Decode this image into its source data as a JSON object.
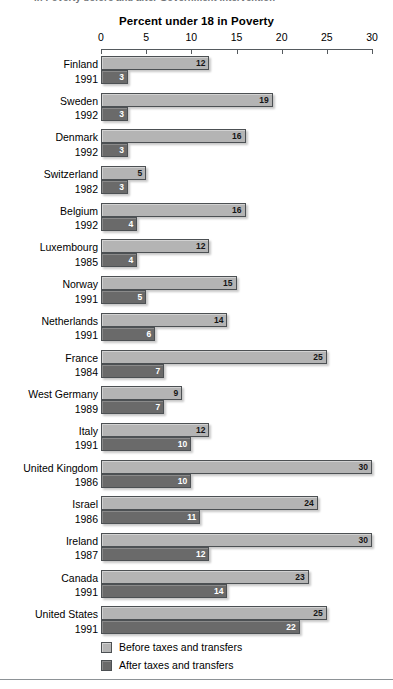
{
  "title_clipped": "in Poverty before and after Government Intervention",
  "axis_title": "Percent under 18 in Poverty",
  "legend": {
    "items": [
      {
        "label": "Before taxes and transfers",
        "color": "#b4b4b4",
        "swatch": "before"
      },
      {
        "label": "After taxes and transfers",
        "color": "#6a6a6a",
        "swatch": "after"
      }
    ]
  },
  "chart_data": {
    "type": "bar",
    "orientation": "horizontal",
    "title": "Percent under 18 in Poverty",
    "xlabel": "Percent under 18 in Poverty",
    "ylabel": "",
    "xlim": [
      0,
      30
    ],
    "xticks": [
      0,
      5,
      10,
      15,
      20,
      25,
      30
    ],
    "grid": false,
    "legend_position": "bottom-left",
    "categories": [
      "Finland 1991",
      "Sweden 1992",
      "Denmark 1992",
      "Switzerland 1982",
      "Belgium 1992",
      "Luxembourg 1985",
      "Norway 1991",
      "Netherlands 1991",
      "France 1984",
      "West Germany 1989",
      "Italy 1991",
      "United Kingdom 1986",
      "Israel 1986",
      "Ireland 1987",
      "Canada 1991",
      "United States 1991"
    ],
    "series": [
      {
        "name": "Before taxes and transfers",
        "color": "#b4b4b4",
        "values": [
          12,
          19,
          16,
          5,
          16,
          12,
          15,
          14,
          25,
          9,
          12,
          30,
          24,
          30,
          23,
          25
        ]
      },
      {
        "name": "After taxes and transfers",
        "color": "#6a6a6a",
        "values": [
          3,
          3,
          3,
          3,
          4,
          4,
          5,
          6,
          7,
          7,
          10,
          10,
          11,
          12,
          14,
          22
        ]
      }
    ]
  },
  "rows": [
    {
      "country": "Finland",
      "year": "1991",
      "before": 12,
      "after": 3
    },
    {
      "country": "Sweden",
      "year": "1992",
      "before": 19,
      "after": 3
    },
    {
      "country": "Denmark",
      "year": "1992",
      "before": 16,
      "after": 3
    },
    {
      "country": "Switzerland",
      "year": "1982",
      "before": 5,
      "after": 3
    },
    {
      "country": "Belgium",
      "year": "1992",
      "before": 16,
      "after": 4
    },
    {
      "country": "Luxembourg",
      "year": "1985",
      "before": 12,
      "after": 4
    },
    {
      "country": "Norway",
      "year": "1991",
      "before": 15,
      "after": 5
    },
    {
      "country": "Netherlands",
      "year": "1991",
      "before": 14,
      "after": 6
    },
    {
      "country": "France",
      "year": "1984",
      "before": 25,
      "after": 7
    },
    {
      "country": "West Germany",
      "year": "1989",
      "before": 9,
      "after": 7
    },
    {
      "country": "Italy",
      "year": "1991",
      "before": 12,
      "after": 10
    },
    {
      "country": "United Kingdom",
      "year": "1986",
      "before": 30,
      "after": 10
    },
    {
      "country": "Israel",
      "year": "1986",
      "before": 24,
      "after": 11
    },
    {
      "country": "Ireland",
      "year": "1987",
      "before": 30,
      "after": 12
    },
    {
      "country": "Canada",
      "year": "1991",
      "before": 23,
      "after": 14
    },
    {
      "country": "United States",
      "year": "1991",
      "before": 25,
      "after": 22
    }
  ]
}
